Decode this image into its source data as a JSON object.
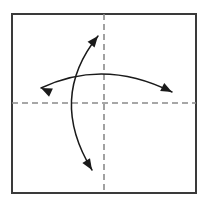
{
  "canvas": {
    "width": 209,
    "height": 212,
    "background_color": "#ffffff"
  },
  "figure": {
    "name": "origami-fold-diagram",
    "frame": {
      "name": "paper-square-frame",
      "x": 12,
      "y": 14,
      "width": 184,
      "height": 179,
      "stroke_color": "#3a3a3a",
      "stroke_width": 2,
      "fill_color": "#ffffff"
    },
    "crease_lines": [
      {
        "name": "vertical-crease-line",
        "orientation": "vertical",
        "x1": 104,
        "y1": 14,
        "x2": 104,
        "y2": 193,
        "stroke_color": "#8a8a8a",
        "stroke_width": 1.6,
        "dash_pattern": "6 4"
      },
      {
        "name": "horizontal-crease-line",
        "orientation": "horizontal",
        "x1": 12,
        "y1": 103,
        "x2": 196,
        "y2": 103,
        "stroke_color": "#8a8a8a",
        "stroke_width": 1.6,
        "dash_pattern": "6 4"
      }
    ],
    "arrows": [
      {
        "name": "horizontal-rotation-arrow",
        "label": "arc spanning left to right over the top crease midpoint",
        "path": "M 41 88 Q 104 58 172 92",
        "stroke_color": "#1a1a1a",
        "stroke_width": 1.5,
        "head_start": true,
        "head_end": true,
        "head_start_point": [
          41,
          88
        ],
        "head_start_angle_deg": 205,
        "head_end_point": [
          172,
          92
        ],
        "head_end_angle_deg": 27
      },
      {
        "name": "vertical-rotation-arrow",
        "label": "arc bulging left from upper right down to lower middle",
        "path": "M 98 36 Q 48 98 92 170",
        "stroke_color": "#1a1a1a",
        "stroke_width": 1.5,
        "head_start": true,
        "head_end": true,
        "head_start_point": [
          98,
          36
        ],
        "head_start_angle_deg": -51,
        "head_end_point": [
          92,
          170
        ],
        "head_end_angle_deg": 58
      }
    ],
    "arrowhead": {
      "length": 11,
      "half_width": 4.5,
      "fill_color": "#1a1a1a"
    }
  }
}
